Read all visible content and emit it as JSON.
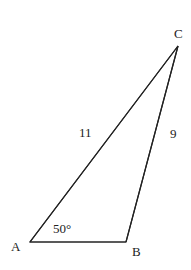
{
  "diagram": {
    "type": "triangle",
    "colors": {
      "background": "#ffffff",
      "stroke": "#222222",
      "text": "#222222"
    },
    "vertices": {
      "A": {
        "label": "A",
        "x": 30,
        "y": 242
      },
      "B": {
        "label": "B",
        "x": 126,
        "y": 242
      },
      "C": {
        "label": "C",
        "x": 178,
        "y": 46
      }
    },
    "labels": {
      "vertex_a": "A",
      "vertex_b": "B",
      "vertex_c": "C",
      "side_ac": "11",
      "side_bc": "9",
      "angle_a": "50°"
    }
  }
}
